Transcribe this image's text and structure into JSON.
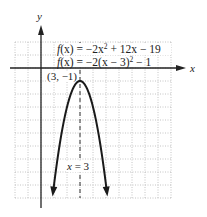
{
  "chart_data": {
    "type": "line",
    "title": "",
    "xlabel": "x",
    "ylabel": "y",
    "xlim": [
      -2,
      10
    ],
    "ylim": [
      -10,
      2
    ],
    "grid": true,
    "grid_step": 1,
    "series": [
      {
        "name": "f(x) = -2x^2 + 12x - 19",
        "function": "-2*(x-3)^2 - 1",
        "x": [
          0.88,
          1,
          1.5,
          2,
          2.5,
          3,
          3.5,
          4,
          4.5,
          5,
          5.12
        ],
        "y": [
          -10,
          -9,
          -5.5,
          -3,
          -1.5,
          -1,
          -1.5,
          -3,
          -5.5,
          -9,
          -10
        ],
        "color": "#1a1a1a",
        "arrows": "both-ends"
      }
    ],
    "annotations": [
      {
        "text": "f(x) = −2x² + 12x − 19",
        "line1_parts": [
          "f",
          "(x)",
          " = −2",
          "x",
          "2",
          " + 12",
          "x",
          " − 19"
        ]
      },
      {
        "text": "f(x) = −2(x − 3)² − 1"
      },
      {
        "text": "(3, −1)",
        "point": [
          3,
          -1
        ],
        "label": "vertex"
      },
      {
        "text": "x = 3",
        "type": "axis-of-symmetry",
        "x": 3
      }
    ],
    "labels": {
      "eq1_f": "f",
      "eq1_rest": "(x) = −2x",
      "eq1_exp": "2",
      "eq1_tail": " + 12x − 19",
      "eq2_f": "f",
      "eq2_rest": "(x) = −2(x − 3)",
      "eq2_exp": "2",
      "eq2_tail": " − 1",
      "vertex": "(3, −1)",
      "axis_of_symmetry": "x = 3",
      "x_axis": "x",
      "y_axis": "y"
    }
  }
}
